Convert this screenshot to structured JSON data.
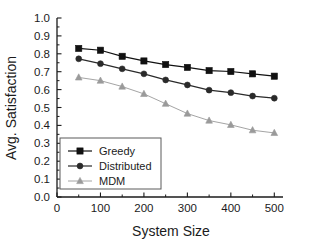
{
  "chart_data": {
    "type": "line",
    "title": "",
    "xlabel": "System Size",
    "ylabel": "Avg. Satisfaction",
    "xlim": [
      0,
      520
    ],
    "ylim": [
      0.0,
      1.0
    ],
    "xticks": [
      0,
      100,
      200,
      300,
      400,
      500
    ],
    "xtick_labels": [
      "0",
      "100",
      "200",
      "300",
      "400",
      "500"
    ],
    "yticks": [
      0.0,
      0.1,
      0.2,
      0.3,
      0.4,
      0.5,
      0.6,
      0.7,
      0.8,
      0.9,
      1.0
    ],
    "ytick_labels": [
      "0.0",
      "0.1",
      "0.2",
      "0.3",
      "0.4",
      "0.5",
      "0.6",
      "0.7",
      "0.8",
      "0.9",
      "1.0"
    ],
    "grid": false,
    "legend_position": "lower-left",
    "x": [
      50,
      100,
      150,
      200,
      250,
      300,
      350,
      400,
      450,
      500
    ],
    "series": [
      {
        "name": "Greedy",
        "marker": "square",
        "color": "#111111",
        "values": [
          0.83,
          0.82,
          0.786,
          0.76,
          0.74,
          0.724,
          0.706,
          0.701,
          0.688,
          0.675
        ]
      },
      {
        "name": "Distributed",
        "marker": "circle",
        "color": "#2a2a2a",
        "values": [
          0.772,
          0.745,
          0.716,
          0.688,
          0.654,
          0.626,
          0.597,
          0.583,
          0.564,
          0.552
        ]
      },
      {
        "name": "MDM",
        "marker": "triangle",
        "color": "#9a9a9a",
        "values": [
          0.668,
          0.65,
          0.617,
          0.576,
          0.521,
          0.466,
          0.427,
          0.403,
          0.373,
          0.358
        ]
      }
    ]
  },
  "legend": {
    "entries": [
      {
        "label": "Greedy"
      },
      {
        "label": "Distributed"
      },
      {
        "label": "MDM"
      }
    ]
  },
  "axes": {
    "x_title": "System Size",
    "y_title": "Avg. Satisfaction"
  }
}
